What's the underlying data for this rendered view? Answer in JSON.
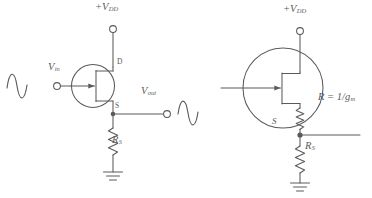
{
  "figure": {
    "kind": "electronic-circuit-diagram",
    "stroke_color": "#5a5a5a",
    "background_color": "#ffffff",
    "partial_text_top_left": "",
    "circuits": [
      {
        "id": "source-follower",
        "name": "Source follower amplifier circuit",
        "labels": {
          "supply": "+V",
          "supply_sub": "DD",
          "input": "V",
          "input_sub": "in",
          "output": "V",
          "output_sub": "out",
          "drain": "D",
          "source": "S",
          "resistor": "R",
          "resistor_sub": "S"
        },
        "elements": [
          "ac-input-sine-wave",
          "input-terminal",
          "jfet-transistor",
          "supply-terminal",
          "output-terminal",
          "ac-output-sine-wave",
          "source-resistor",
          "ground"
        ]
      },
      {
        "id": "small-signal-equivalent",
        "name": "Equivalent circuit with transconductance resistance",
        "labels": {
          "supply": "+V",
          "supply_sub": "DD",
          "source": "S",
          "resistance_expr": "R = 1/g",
          "resistance_sub": "m",
          "resistor": "R",
          "resistor_sub": "S"
        },
        "elements": [
          "gate-input-line",
          "jfet-transistor-large",
          "internal-transconductance-resistor",
          "supply-terminal",
          "source-node",
          "source-output-line",
          "source-resistor",
          "ground"
        ]
      }
    ]
  }
}
